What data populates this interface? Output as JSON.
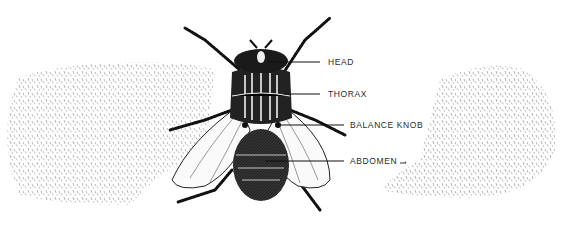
{
  "diagram": {
    "view": "dorsal",
    "colors": {
      "ink": "#1a1a1a",
      "stipple": "#6a6a6a",
      "background": "#ffffff"
    },
    "labels": [
      {
        "id": "head",
        "text": "HEAD",
        "x": 328,
        "y": 57
      },
      {
        "id": "thorax",
        "text": "THORAX",
        "x": 328,
        "y": 89
      },
      {
        "id": "balance-knob",
        "text": "BALANCE KNOB",
        "x": 350,
        "y": 120
      },
      {
        "id": "abdomen",
        "text": "ABDOMEN",
        "x": 350,
        "y": 156
      }
    ]
  }
}
